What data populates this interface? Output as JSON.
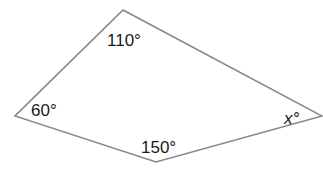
{
  "diagram": {
    "type": "quadrilateral",
    "stroke_color": "#888888",
    "text_color": "#1a1a1a",
    "vertices": {
      "top": {
        "x": 123,
        "y": 10
      },
      "left": {
        "x": 15,
        "y": 116
      },
      "bottom": {
        "x": 156,
        "y": 162
      },
      "right": {
        "x": 322,
        "y": 116
      }
    },
    "angles": {
      "top": {
        "label": "110°",
        "value": 110
      },
      "left": {
        "label": "60°",
        "value": 60
      },
      "bottom": {
        "label": "150°",
        "value": 150
      },
      "right": {
        "label": "x°",
        "variable": "x"
      }
    }
  }
}
